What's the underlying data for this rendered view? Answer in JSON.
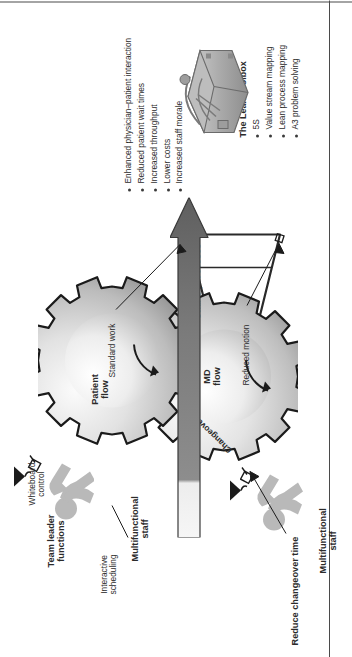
{
  "figure": {
    "orientation": "rotated-90-ccw",
    "background": "#ffffff",
    "labels": {
      "team_leader_functions": "Team leader\nfunctions",
      "team_leader_line1": "Team leader",
      "team_leader_line2": "functions",
      "interactive_scheduling_l1": "Interactive",
      "interactive_scheduling_l2": "scheduling",
      "whiteboard_control_l1": "Whiteboard",
      "whiteboard_control_l2": "control",
      "multifunctional_staff_top_l1": "Multifunctional",
      "multifunctional_staff_top_l2": "staff",
      "multifunctional_staff_bottom_l1": "Multifunctional",
      "multifunctional_staff_bottom_l2": "staff",
      "standard_work": "Standard work",
      "reduced_motion": "Reduced motion",
      "reduce_changeover_time": "Reduce changeover time",
      "stable_processes": "Stable processes",
      "patient_flow_l1": "Patient",
      "patient_flow_l2": "flow",
      "md_flow_l1": "MD",
      "md_flow_l2": "flow",
      "changeover": "Changeover"
    },
    "outcomes": {
      "items": [
        "Enhanced physician–patient interaction",
        "Reduced patient wait times",
        "Increased throughput",
        "Lower costs",
        "Increased staff morale"
      ]
    },
    "toolbox": {
      "title": "The Lean Toolbox",
      "items": [
        "5S",
        "Value stream mapping",
        "Lean process mapping",
        "A3 problem solving"
      ]
    },
    "colors": {
      "ink": "#2b2b2b",
      "gear_outline": "#1b1b1b",
      "gear_light": "#f2f2f2",
      "gear_mid": "#c9c9c9",
      "gear_dark": "#8d8d8d",
      "arrow_fill": "#6f6f6f",
      "arrow_tail": "#f4f4f4",
      "stick_figure": "#b9b9b9",
      "wedge_fill": "#ffffff",
      "wedge_edge": "#2a2a2a",
      "toolbox": "#a8a8a8",
      "trim": "#4a4a4a"
    }
  }
}
